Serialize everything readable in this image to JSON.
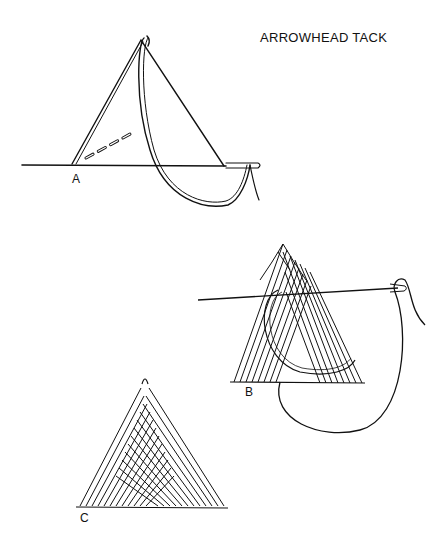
{
  "title": "ARROWHEAD TACK",
  "figures": [
    {
      "id": "A",
      "label": "A",
      "description": "Needle inserted along base line of triangle, thread looped from apex"
    },
    {
      "id": "B",
      "label": "B",
      "description": "Partially worked arrowhead tack with needle passing through upper layers"
    },
    {
      "id": "C",
      "label": "C",
      "description": "Completed arrowhead tack filled with parallel stitches"
    }
  ],
  "colors": {
    "ink": "#111111",
    "paper": "#ffffff"
  }
}
